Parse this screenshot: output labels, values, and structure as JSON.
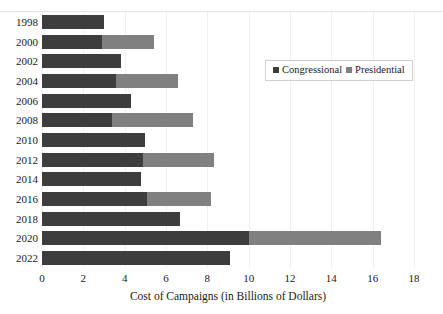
{
  "chart_data": {
    "type": "bar",
    "orientation": "horizontal",
    "stacked": true,
    "title": "",
    "xlabel": "Cost of Campaigns (in Billions of Dollars)",
    "ylabel": "",
    "xlim": [
      0,
      18
    ],
    "xticks": [
      0,
      2,
      4,
      6,
      8,
      10,
      12,
      14,
      16,
      18
    ],
    "xtick_labels": [
      "0",
      "2",
      "4",
      "6",
      "8",
      "10",
      "12",
      "14",
      "16",
      "18"
    ],
    "grid": true,
    "grid_axis": "x",
    "legend_position": "upper right",
    "categories": [
      "1998",
      "2000",
      "2002",
      "2004",
      "2006",
      "2008",
      "2010",
      "2012",
      "2014",
      "2016",
      "2018",
      "2020",
      "2022"
    ],
    "series": [
      {
        "name": "Congressional",
        "color": "#3d3d3d",
        "values": [
          3.0,
          2.9,
          3.8,
          3.6,
          4.3,
          3.4,
          5.0,
          4.9,
          4.8,
          5.1,
          6.7,
          10.0,
          9.1
        ]
      },
      {
        "name": "Presidential",
        "color": "#808080",
        "values": [
          0.0,
          2.5,
          0.0,
          3.0,
          0.0,
          3.9,
          0.0,
          3.4,
          0.0,
          3.1,
          0.0,
          6.4,
          0.0
        ]
      }
    ],
    "totals": [
      3.0,
      5.4,
      3.8,
      6.6,
      4.3,
      7.3,
      5.0,
      8.3,
      4.8,
      8.2,
      6.7,
      16.4,
      9.1
    ]
  },
  "legend": {
    "items": [
      {
        "label": "Congressional",
        "color": "#3d3d3d"
      },
      {
        "label": "Presidential",
        "color": "#808080"
      }
    ]
  },
  "axis": {
    "x_title": "Cost of Campaigns (in Billions of Dollars)"
  },
  "colors": {
    "congressional": "#3d3d3d",
    "presidential": "#808080",
    "gridline": "#f0f0f0",
    "background": "#ffffff",
    "text": "#1a1a1a"
  }
}
